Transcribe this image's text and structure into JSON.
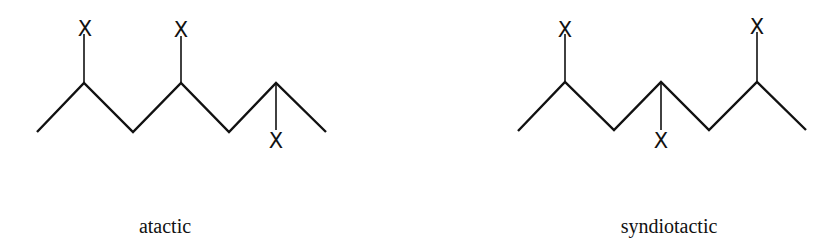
{
  "diagrams": [
    {
      "caption": "atactic",
      "caption_pos": [
        165,
        233
      ],
      "backbone": [
        [
          37,
          132
        ],
        [
          84,
          83
        ],
        [
          133,
          132
        ],
        [
          181,
          83
        ],
        [
          229,
          132
        ],
        [
          276,
          83
        ],
        [
          326,
          132
        ]
      ],
      "substituents": [
        {
          "label": "X",
          "from": [
            84,
            83
          ],
          "to": [
            84,
            34
          ],
          "label_pos": [
            85,
            36
          ]
        },
        {
          "label": "X",
          "from": [
            181,
            83
          ],
          "to": [
            181,
            36
          ],
          "label_pos": [
            181,
            37
          ]
        },
        {
          "label": "X",
          "from": [
            276,
            83
          ],
          "to": [
            276,
            130
          ],
          "label_pos": [
            276,
            148
          ]
        }
      ]
    },
    {
      "caption": "syndiotactic",
      "caption_pos": [
        669,
        233
      ],
      "backbone": [
        [
          518,
          131
        ],
        [
          565,
          82
        ],
        [
          614,
          130
        ],
        [
          661,
          82
        ],
        [
          709,
          130
        ],
        [
          757,
          82
        ],
        [
          806,
          130
        ]
      ],
      "substituents": [
        {
          "label": "X",
          "from": [
            565,
            82
          ],
          "to": [
            565,
            34
          ],
          "label_pos": [
            565,
            37
          ]
        },
        {
          "label": "X",
          "from": [
            661,
            82
          ],
          "to": [
            661,
            130
          ],
          "label_pos": [
            661,
            148
          ]
        },
        {
          "label": "X",
          "from": [
            757,
            82
          ],
          "to": [
            757,
            32
          ],
          "label_pos": [
            757,
            34
          ]
        }
      ]
    }
  ],
  "colors": {
    "ink": "#111111",
    "background": "#ffffff"
  }
}
